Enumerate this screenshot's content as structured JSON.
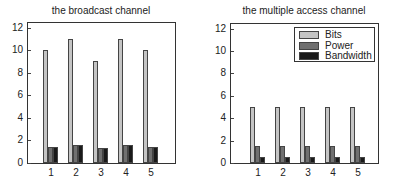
{
  "colors": {
    "bits": "#c4c4c4",
    "power": "#707070",
    "bandwidth": "#1a1a1a"
  },
  "chart_data": [
    {
      "type": "bar",
      "title": "the broadcast channel",
      "xlabel": "",
      "ylabel": "",
      "categories": [
        "1",
        "2",
        "3",
        "4",
        "5"
      ],
      "yticks": [
        "0",
        "2",
        "4",
        "6",
        "8",
        "10",
        "12"
      ],
      "ylim": [
        0,
        12.5
      ],
      "grid": false,
      "legend": null,
      "series": [
        {
          "name": "Bits",
          "values": [
            10,
            11,
            9,
            11,
            10
          ]
        },
        {
          "name": "Power",
          "values": [
            1.4,
            1.6,
            1.3,
            1.6,
            1.4
          ]
        },
        {
          "name": "Bandwidth",
          "values": [
            1.4,
            1.6,
            1.3,
            1.6,
            1.4
          ]
        }
      ]
    },
    {
      "type": "bar",
      "title": "the multiple access channel",
      "xlabel": "",
      "ylabel": "",
      "categories": [
        "1",
        "2",
        "3",
        "4",
        "5"
      ],
      "yticks": [
        "0",
        "2",
        "4",
        "6",
        "8",
        "10",
        "12"
      ],
      "ylim": [
        0,
        12.5
      ],
      "grid": false,
      "legend": {
        "position": "upper right",
        "entries": [
          "Bits",
          "Power",
          "Bandwidth"
        ]
      },
      "series": [
        {
          "name": "Bits",
          "values": [
            5,
            5,
            5,
            5,
            5
          ]
        },
        {
          "name": "Power",
          "values": [
            1.5,
            1.5,
            1.5,
            1.5,
            1.5
          ]
        },
        {
          "name": "Bandwidth",
          "values": [
            0.5,
            0.5,
            0.5,
            0.5,
            0.5
          ]
        }
      ]
    }
  ]
}
